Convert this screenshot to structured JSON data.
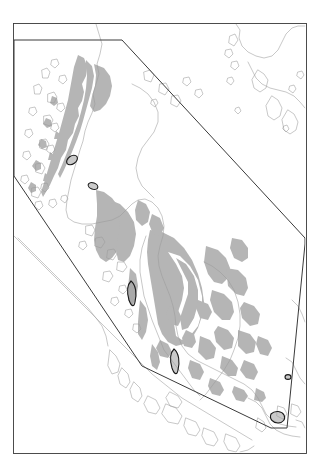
{
  "figure": {
    "type": "region-map",
    "title": "",
    "caption": "",
    "background_color": "#ffffff",
    "header_artifact": "·"
  },
  "map": {
    "frame": {
      "label": "map-frame",
      "x": 13,
      "y": 23,
      "width": 293,
      "height": 430,
      "stroke": "#3a3a3a",
      "stroke_width": 0.9,
      "fill": "#ffffff"
    },
    "legend_text": "",
    "scale_text": "",
    "north_arrow": "",
    "annotation_label": "",
    "colors": {
      "coastline": "#9a9a9a",
      "shaded_area": "#b5b5b5",
      "highlight_outline": "#1a1a1a",
      "highlight_fill": "#9e9e9e",
      "study_polygon": "#3a3a3a",
      "frame": "#3a3a3a",
      "ocean": "#ffffff",
      "land": "#ffffff"
    },
    "study_polygon": {
      "label": "study-area-boundary",
      "stroke_width": 1.0,
      "points": "14,40 122,40 305,238 305,244 287,428 271,428 142,366 14,176"
    },
    "layers": [
      {
        "name": "coastlines",
        "visible": true
      },
      {
        "name": "shaded-distribution",
        "visible": true
      },
      {
        "name": "highlight-sites",
        "visible": true
      },
      {
        "name": "study-boundary",
        "visible": true
      }
    ],
    "highlight_sites": [
      {
        "name": "site-north-a",
        "cx": 72,
        "cy": 160,
        "rx": 6.0,
        "ry": 4.0,
        "rot": -35
      },
      {
        "name": "site-north-b",
        "cx": 93,
        "cy": 186,
        "rx": 5.0,
        "ry": 3.2,
        "rot": 20
      },
      {
        "name": "site-central",
        "cx": 133,
        "cy": 293,
        "rx": 4.0,
        "ry": 12.0,
        "rot": 10
      },
      {
        "name": "site-south",
        "cx": 175,
        "cy": 360,
        "rx": 4.0,
        "ry": 11.0,
        "rot": -6
      },
      {
        "name": "site-islet",
        "cx": 288,
        "cy": 377,
        "rx": 3.0,
        "ry": 2.4,
        "rot": 0
      },
      {
        "name": "site-singapore",
        "cx": 277,
        "cy": 417,
        "rx": 6.0,
        "ry": 4.5,
        "rot": 0
      }
    ]
  }
}
